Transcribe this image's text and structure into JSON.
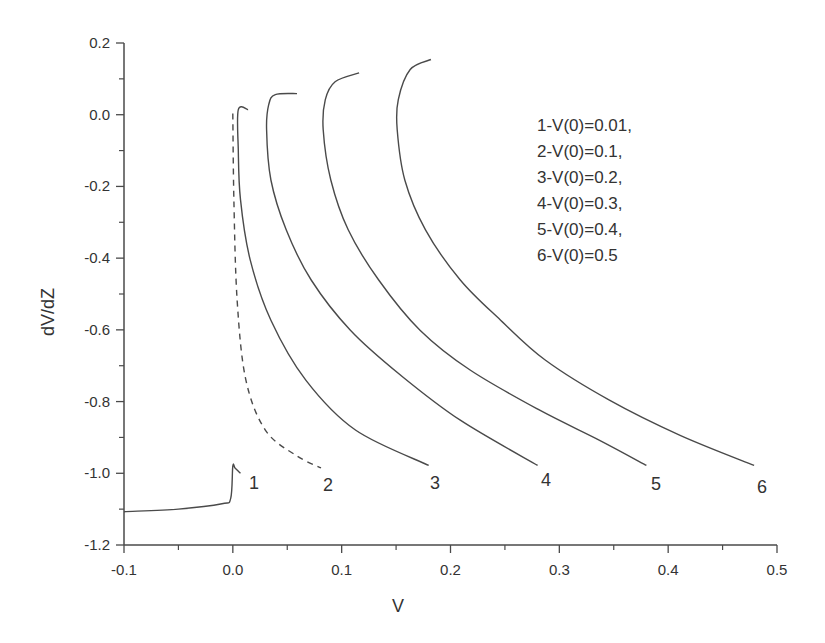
{
  "chart_data": {
    "type": "line",
    "title": "",
    "xlabel": "V",
    "ylabel": "dV/dZ",
    "xlim": [
      -0.1,
      0.5
    ],
    "ylim": [
      -1.2,
      0.2
    ],
    "grid": false,
    "x_ticks": [
      "-0.1",
      "0.0",
      "0.1",
      "0.2",
      "0.3",
      "0.4",
      "0.5"
    ],
    "y_ticks": [
      "0.2",
      "0.0",
      "-0.2",
      "-0.4",
      "-0.6",
      "-0.8",
      "-1.0",
      "-1.2"
    ],
    "legend": {
      "position": "upper right (inside)",
      "entries": [
        "1-V(0)=0.01,",
        "2-V(0)=0.1,",
        "3-V(0)=0.2,",
        "4-V(0)=0.3,",
        "5-V(0)=0.4,",
        "6-V(0)=0.5"
      ]
    },
    "series": [
      {
        "name": "1",
        "label": "1",
        "style": "solid",
        "points": [
          [
            -0.1,
            -1.107
          ],
          [
            -0.05,
            -1.1
          ],
          [
            -0.01,
            -1.085
          ],
          [
            -0.002,
            -1.07
          ],
          [
            0.0,
            -0.98
          ],
          [
            0.002,
            -0.985
          ],
          [
            0.007,
            -1.0
          ]
        ]
      },
      {
        "name": "2",
        "label": "2",
        "style": "dashed",
        "points": [
          [
            0.0,
            0.003
          ],
          [
            0.001,
            -0.24
          ],
          [
            0.004,
            -0.52
          ],
          [
            0.012,
            -0.74
          ],
          [
            0.03,
            -0.88
          ],
          [
            0.058,
            -0.95
          ],
          [
            0.081,
            -0.985
          ]
        ]
      },
      {
        "name": "3",
        "label": "3",
        "style": "solid",
        "points": [
          [
            0.014,
            0.014
          ],
          [
            0.005,
            0.014
          ],
          [
            0.005,
            -0.098
          ],
          [
            0.007,
            -0.237
          ],
          [
            0.016,
            -0.405
          ],
          [
            0.035,
            -0.573
          ],
          [
            0.067,
            -0.74
          ],
          [
            0.113,
            -0.88
          ],
          [
            0.18,
            -0.978
          ]
        ]
      },
      {
        "name": "4",
        "label": "4",
        "style": "solid",
        "points": [
          [
            0.059,
            0.059
          ],
          [
            0.039,
            0.056
          ],
          [
            0.033,
            0.028
          ],
          [
            0.031,
            -0.042
          ],
          [
            0.035,
            -0.182
          ],
          [
            0.049,
            -0.321
          ],
          [
            0.072,
            -0.461
          ],
          [
            0.108,
            -0.601
          ],
          [
            0.154,
            -0.726
          ],
          [
            0.209,
            -0.852
          ],
          [
            0.28,
            -0.978
          ]
        ]
      },
      {
        "name": "5",
        "label": "5",
        "style": "solid",
        "points": [
          [
            0.116,
            0.117
          ],
          [
            0.094,
            0.092
          ],
          [
            0.085,
            0.042
          ],
          [
            0.083,
            -0.042
          ],
          [
            0.09,
            -0.182
          ],
          [
            0.106,
            -0.321
          ],
          [
            0.134,
            -0.461
          ],
          [
            0.172,
            -0.601
          ],
          [
            0.218,
            -0.712
          ],
          [
            0.282,
            -0.824
          ],
          [
            0.337,
            -0.908
          ],
          [
            0.38,
            -0.978
          ]
        ]
      },
      {
        "name": "6",
        "label": "6",
        "style": "solid",
        "points": [
          [
            0.182,
            0.154
          ],
          [
            0.163,
            0.126
          ],
          [
            0.152,
            0.042
          ],
          [
            0.151,
            -0.042
          ],
          [
            0.158,
            -0.182
          ],
          [
            0.177,
            -0.321
          ],
          [
            0.209,
            -0.461
          ],
          [
            0.246,
            -0.573
          ],
          [
            0.287,
            -0.684
          ],
          [
            0.346,
            -0.796
          ],
          [
            0.411,
            -0.894
          ],
          [
            0.479,
            -0.978
          ]
        ]
      }
    ],
    "colors": {
      "lines": "#4a4a4a",
      "text": "#333333",
      "background": "#ffffff"
    }
  }
}
